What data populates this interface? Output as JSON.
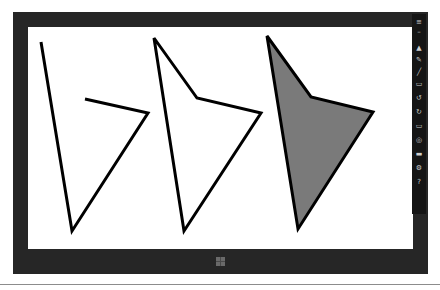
{
  "screen": {
    "frame_color": "#262626",
    "canvas_color": "#ffffff"
  },
  "shapes": [
    {
      "name": "open-polyline",
      "points": "13,15 44,204 120,86 57,72",
      "fill": "none",
      "stroke": "#000000"
    },
    {
      "name": "outlined-polygon",
      "points": "126,11 169,71 233,86 156,204",
      "fill": "none",
      "stroke": "#000000"
    },
    {
      "name": "filled-polygon",
      "points": "239,9 283,70 345,85 270,202",
      "fill": "#7a7a7a",
      "stroke": "#000000"
    }
  ],
  "toolbar": {
    "tools": [
      {
        "name": "menu-icon",
        "glyph": "≡"
      },
      {
        "name": "minimize-icon",
        "glyph": "–"
      },
      {
        "name": "pointer-icon",
        "glyph": "▲"
      },
      {
        "name": "pen-icon",
        "glyph": "✎"
      },
      {
        "name": "line-icon",
        "glyph": "╱"
      },
      {
        "name": "shape-icon",
        "glyph": "▭"
      },
      {
        "name": "undo-icon",
        "glyph": "↺"
      },
      {
        "name": "redo-icon",
        "glyph": "↻"
      },
      {
        "name": "screen-icon",
        "glyph": "▭"
      },
      {
        "name": "globe-icon",
        "glyph": "◎"
      },
      {
        "name": "folder-icon",
        "glyph": "▬"
      },
      {
        "name": "settings-icon",
        "glyph": "⚙"
      },
      {
        "name": "help-icon",
        "glyph": "?"
      }
    ]
  },
  "taskbar": {
    "start_icon": "windows-logo"
  }
}
